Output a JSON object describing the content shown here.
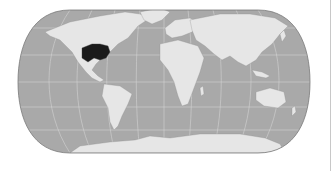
{
  "map": {
    "projection": "Eckert IV (pseudocylindrical)",
    "colors": {
      "ocean": "#a9a9a9",
      "land": "#e6e6e6",
      "highlight": "#1a1a1a",
      "graticule": "#d4d4d4",
      "border": "#7a7a7a"
    },
    "highlighted_region": "Central United States (Mississippi basin / Midwest)"
  }
}
